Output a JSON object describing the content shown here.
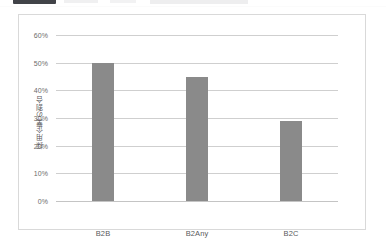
{
  "top_strip": {
    "chip_label": ""
  },
  "chart_data": {
    "type": "bar",
    "title": "",
    "subtitle": "",
    "xlabel": "",
    "ylabel": "採用企業の割合",
    "categories": [
      "B2B",
      "B2Any",
      "B2C"
    ],
    "values": [
      50,
      45,
      29
    ],
    "value_labels": [
      "50%",
      "45%",
      "29%"
    ],
    "ylim": [
      0,
      60
    ],
    "ytick_values": [
      0,
      10,
      20,
      30,
      40,
      50,
      60
    ],
    "ytick_labels": [
      "0%",
      "10%",
      "20%",
      "30%",
      "40%",
      "50%",
      "60%"
    ],
    "grid": true,
    "legend": false,
    "legend_position": "none",
    "bar_color": "#8a8a8a",
    "gridline_color": "#cfcfcf",
    "border_color": "#d9d9d9",
    "background_color": "#ffffff"
  }
}
